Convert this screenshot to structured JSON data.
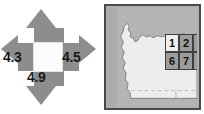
{
  "figure": {
    "background_color": "#ffffff",
    "panels": [
      "direction-arrow-diagram",
      "map-with-grid-overlay"
    ]
  },
  "arrow_diagram": {
    "name": "four-direction-arrow",
    "arrow_color": "#8d8d8d",
    "center_color": "#fbfbfb",
    "label_color": "#1a1a1a",
    "directions": [
      {
        "key": "north",
        "label": "",
        "visible": false
      },
      {
        "key": "west",
        "label": "4.3",
        "visible": true
      },
      {
        "key": "east",
        "label": "4.5",
        "visible": true
      },
      {
        "key": "south",
        "label": "4.9",
        "visible": true
      }
    ],
    "values": {
      "north": "",
      "west": "4.3",
      "east": "4.5",
      "south": "4.9"
    }
  },
  "map": {
    "name": "state-outline-map",
    "frame_color": "#4a4a4a",
    "surround_color": "#ababab",
    "land_color": "#ededed",
    "grid": {
      "columns": 3,
      "rows": 2,
      "cells": [
        {
          "label": "1",
          "highlight": true
        },
        {
          "label": "2",
          "highlight": false
        },
        {
          "label": "3",
          "highlight": false
        },
        {
          "label": "6",
          "highlight": false
        },
        {
          "label": "7",
          "highlight": false
        },
        {
          "label": "8",
          "highlight": false
        }
      ],
      "cell_border_color": "#3f3f3f",
      "cell_fill_color": "#9d9d9d",
      "cell_text_color": "#101010"
    }
  }
}
